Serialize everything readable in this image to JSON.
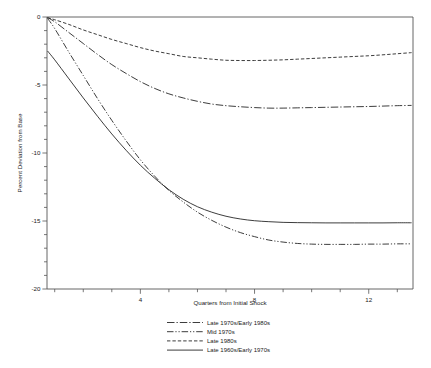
{
  "chart_data": {
    "type": "line",
    "title": "",
    "xlabel": "Quarters from Initial Shock",
    "ylabel": "Percent Deviation from Base",
    "xlim": [
      0.73,
      13.55
    ],
    "ylim": [
      -20,
      0
    ],
    "grid": false,
    "legend_position": "below-axes-center",
    "x_ticks_major": [
      4,
      8,
      12
    ],
    "x_ticks_major_labels": [
      "4",
      "8",
      "12"
    ],
    "x_ticks_minor": [
      1,
      2,
      3,
      5,
      6,
      7,
      9,
      10,
      11,
      13
    ],
    "y_ticks_major": [
      0,
      -5,
      -10,
      -15,
      -20
    ],
    "y_ticks_major_labels": [
      "0",
      "-5",
      "-10",
      "-15",
      "-20"
    ],
    "y_ticks_minor": [
      -1,
      -2,
      -3,
      -4,
      -6,
      -7,
      -8,
      -9,
      -11,
      -12,
      -13,
      -14,
      -16,
      -17,
      -18,
      -19
    ],
    "x": [
      0.75,
      1,
      1.5,
      2,
      2.5,
      3,
      3.5,
      4,
      4.5,
      5,
      5.5,
      6,
      6.5,
      7,
      7.5,
      8,
      8.5,
      9,
      9.5,
      10,
      10.5,
      11,
      11.5,
      12,
      12.5,
      13,
      13.5
    ],
    "series": [
      {
        "name": "Late 1970s/Early 1980s",
        "style": "dash-dot",
        "values": [
          -0.05,
          -0.35,
          -1.15,
          -1.95,
          -2.75,
          -3.5,
          -4.15,
          -4.75,
          -5.25,
          -5.65,
          -5.95,
          -6.2,
          -6.4,
          -6.52,
          -6.6,
          -6.66,
          -6.7,
          -6.7,
          -6.68,
          -6.66,
          -6.64,
          -6.62,
          -6.6,
          -6.58,
          -6.55,
          -6.52,
          -6.5
        ]
      },
      {
        "name": "Mid 1970s",
        "style": "dash-dot-dot",
        "values": [
          -0.1,
          -0.85,
          -2.6,
          -4.3,
          -6.0,
          -7.6,
          -9.1,
          -10.5,
          -11.7,
          -12.75,
          -13.6,
          -14.35,
          -14.95,
          -15.45,
          -15.85,
          -16.15,
          -16.4,
          -16.55,
          -16.65,
          -16.7,
          -16.72,
          -16.72,
          -16.72,
          -16.7,
          -16.7,
          -16.68,
          -16.68
        ]
      },
      {
        "name": "Late 1980s",
        "style": "dashed",
        "values": [
          -0.05,
          -0.2,
          -0.55,
          -0.95,
          -1.3,
          -1.65,
          -1.95,
          -2.25,
          -2.5,
          -2.7,
          -2.9,
          -3.0,
          -3.1,
          -3.18,
          -3.2,
          -3.2,
          -3.18,
          -3.15,
          -3.1,
          -3.05,
          -3.0,
          -2.95,
          -2.9,
          -2.85,
          -2.78,
          -2.7,
          -2.62
        ]
      },
      {
        "name": "Late 1960s/Early 1970s",
        "style": "solid",
        "values": [
          -2.5,
          -3.15,
          -4.55,
          -5.95,
          -7.3,
          -8.6,
          -9.8,
          -10.9,
          -11.85,
          -12.7,
          -13.4,
          -13.95,
          -14.35,
          -14.65,
          -14.85,
          -14.98,
          -15.05,
          -15.1,
          -15.12,
          -15.13,
          -15.14,
          -15.14,
          -15.14,
          -15.14,
          -15.14,
          -15.13,
          -15.13
        ]
      }
    ],
    "annotations": []
  },
  "legend": {
    "entries": [
      {
        "label": "Late 1970s/Early 1980s",
        "style": "dash-dot"
      },
      {
        "label": "Mid 1970s",
        "style": "dash-dot-dot"
      },
      {
        "label": "Late 1980s",
        "style": "dashed"
      },
      {
        "label": "Late 1960s/Early 1970s",
        "style": "solid"
      }
    ]
  },
  "colors": {
    "line": "#1a1a1a",
    "axis": "#555555",
    "background": "#ffffff"
  }
}
